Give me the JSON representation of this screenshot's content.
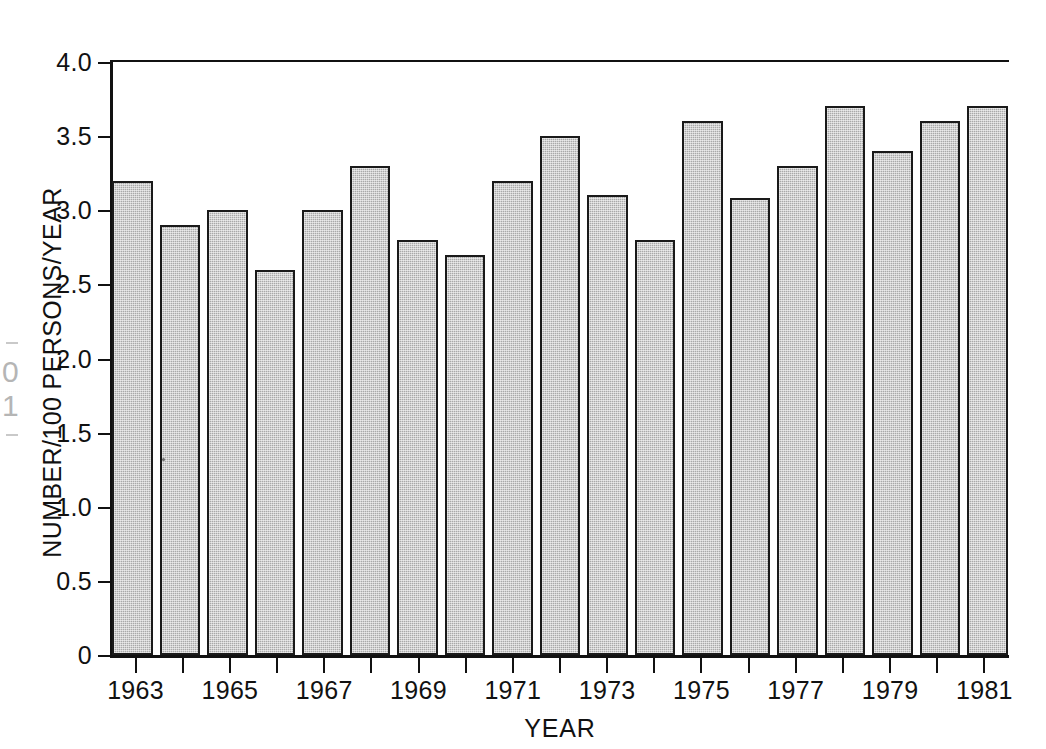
{
  "chart_data": {
    "type": "bar",
    "title": "",
    "xlabel": "YEAR",
    "ylabel": "NUMBER/100 PERSONS/YEAR",
    "categories": [
      "1963",
      "1964",
      "1965",
      "1966",
      "1967",
      "1968",
      "1969",
      "1970",
      "1971",
      "1972",
      "1973",
      "1974",
      "1975",
      "1976",
      "1977",
      "1978",
      "1979",
      "1980",
      "1981"
    ],
    "values": [
      3.2,
      2.9,
      3.0,
      2.6,
      3.0,
      3.3,
      2.8,
      2.7,
      3.2,
      3.5,
      3.1,
      2.8,
      3.6,
      3.08,
      3.3,
      3.7,
      3.4,
      3.6,
      3.7
    ],
    "ylim": [
      0,
      4.0
    ],
    "ytick_values": [
      0,
      0.5,
      1.0,
      1.5,
      2.0,
      2.5,
      3.0,
      3.5,
      4.0
    ],
    "ytick_labels": [
      "0",
      "0.5",
      "1.0",
      "1.5",
      "2.0",
      "2.5",
      "3.0",
      "3.5",
      "4.0"
    ],
    "xtick_labels": [
      "1963",
      "1965",
      "1967",
      "1969",
      "1971",
      "1973",
      "1975",
      "1977",
      "1979",
      "1981"
    ],
    "xtick_labeled_categories": [
      "1963",
      "1965",
      "1967",
      "1969",
      "1971",
      "1973",
      "1975",
      "1977",
      "1979",
      "1981"
    ],
    "grid": false,
    "legend": null,
    "bar_fill_color": "#a9a9a9",
    "bar_edge_color": "#1a1a1a",
    "axis_color": "#111111",
    "background_color": "#ffffff"
  },
  "axes": {
    "y_title": "NUMBER/100 PERSONS/YEAR",
    "x_title": "YEAR"
  }
}
